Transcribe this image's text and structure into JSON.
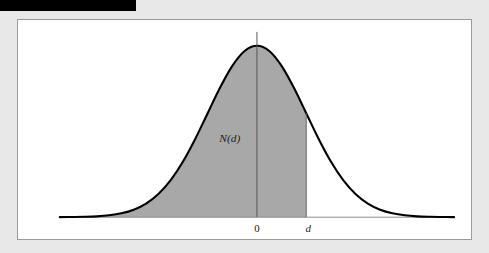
{
  "figure": {
    "redaction_bar": {
      "present": true,
      "color": "#000000"
    },
    "panel": {
      "background": "#ffffff",
      "border_color": "#9a9a9a"
    },
    "colors": {
      "background": "#e8e8e8",
      "curve": "#000000",
      "shaded_area": "#a8a8a8",
      "axis": "#8d8d8d",
      "text": "#1a1a1a"
    }
  },
  "chart_data": {
    "type": "area",
    "title": "",
    "subtitle": "",
    "xlabel": "",
    "ylabel": "",
    "grid": false,
    "legend": null,
    "distribution": "standard normal (Gaussian) probability density",
    "mean": 0,
    "std_dev": 1,
    "xlim": [
      -4.0,
      4.0
    ],
    "ylim": [
      0,
      0.43
    ],
    "tick_labels": [
      "0",
      "d"
    ],
    "tick_values": [
      0,
      1.0
    ],
    "annotations": [
      {
        "text": "N(d)",
        "meaning": "cumulative probability area to the left of d",
        "x": -0.55,
        "y": 0.175
      }
    ],
    "shaded_region": {
      "from": -4.0,
      "to": 1.0,
      "label": "N(d)",
      "color": "#a8a8a8"
    },
    "vertical_lines": [
      {
        "label": "0",
        "x": 0,
        "extends_above_curve": true
      },
      {
        "label": "d",
        "x": 1.0,
        "extends_above_curve": false
      }
    ],
    "x": [
      -4.0,
      -3.75,
      -3.5,
      -3.25,
      -3.0,
      -2.75,
      -2.5,
      -2.25,
      -2.0,
      -1.75,
      -1.5,
      -1.25,
      -1.0,
      -0.75,
      -0.5,
      -0.25,
      0.0,
      0.25,
      0.5,
      0.75,
      1.0,
      1.25,
      1.5,
      1.75,
      2.0,
      2.25,
      2.5,
      2.75,
      3.0,
      3.25,
      3.5,
      3.75,
      4.0
    ],
    "values": [
      0.0001,
      0.0004,
      0.0009,
      0.002,
      0.0044,
      0.0091,
      0.0175,
      0.0317,
      0.054,
      0.0863,
      0.1295,
      0.1826,
      0.242,
      0.3011,
      0.3521,
      0.3867,
      0.3989,
      0.3867,
      0.3521,
      0.3011,
      0.242,
      0.1826,
      0.1295,
      0.0863,
      0.054,
      0.0317,
      0.0175,
      0.0091,
      0.0044,
      0.002,
      0.0009,
      0.0004,
      0.0001
    ]
  }
}
